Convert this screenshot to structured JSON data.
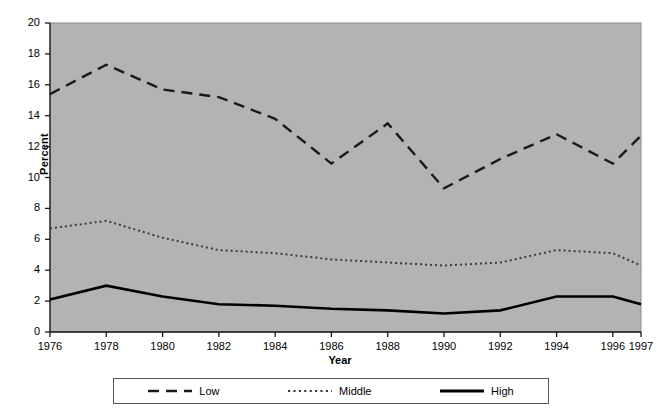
{
  "chart_data": {
    "type": "line",
    "title": "",
    "xlabel": "Year",
    "ylabel": "Percent",
    "categories": [
      "1976",
      "1978",
      "1980",
      "1982",
      "1984",
      "1986",
      "1988",
      "1990",
      "1992",
      "1994",
      "1996",
      "1997"
    ],
    "x": [
      1976,
      1978,
      1980,
      1982,
      1984,
      1986,
      1988,
      1990,
      1992,
      1994,
      1996,
      1997
    ],
    "xlim": [
      1976,
      1997
    ],
    "ylim": [
      0,
      20
    ],
    "yticks": [
      0,
      2,
      4,
      6,
      8,
      10,
      12,
      14,
      16,
      18,
      20
    ],
    "ytick_labels": [
      "0",
      "2",
      "4",
      "6",
      "8",
      "10",
      "12",
      "14",
      "16",
      "18",
      "20"
    ],
    "xticks": [
      1976,
      1978,
      1980,
      1982,
      1984,
      1986,
      1988,
      1990,
      1992,
      1994,
      1996,
      1997
    ],
    "grid": false,
    "legend_position": "below",
    "plot_background": "#b3b3b3",
    "figure_background": "#ffffff",
    "series": [
      {
        "name": "Low",
        "style": "dashed",
        "color": "#1a1a1a",
        "width": 2.4,
        "dash": "11,7",
        "values": [
          15.4,
          17.3,
          15.7,
          15.2,
          13.8,
          10.9,
          13.5,
          9.3,
          11.2,
          12.8,
          10.9,
          12.7
        ]
      },
      {
        "name": "Middle",
        "style": "dotted",
        "color": "#3d3d3d",
        "width": 2.0,
        "dash": "2,3",
        "values": [
          6.7,
          7.2,
          6.1,
          5.3,
          5.1,
          4.7,
          4.5,
          4.3,
          4.5,
          5.3,
          5.1,
          4.3
        ]
      },
      {
        "name": "High",
        "style": "solid",
        "color": "#000000",
        "width": 2.6,
        "dash": "none",
        "values": [
          2.1,
          3.0,
          2.3,
          1.8,
          1.7,
          1.5,
          1.4,
          1.2,
          1.4,
          2.3,
          2.3,
          1.8
        ]
      }
    ]
  },
  "legend": {
    "entries": [
      {
        "label": "Low"
      },
      {
        "label": "Middle"
      },
      {
        "label": "High"
      }
    ]
  },
  "axes": {
    "y_title": "Percent",
    "x_title": "Year"
  }
}
